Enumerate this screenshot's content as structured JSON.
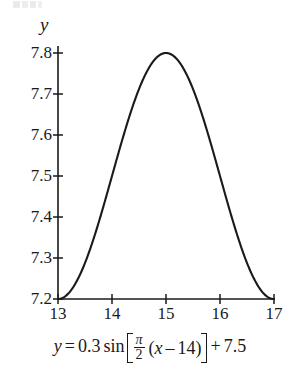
{
  "figure": {
    "axis_label_y": "y",
    "line_color": "#1a1a1a",
    "axis_color": "#1a1a1a",
    "background_color": "#ffffff"
  },
  "equation": {
    "lhs": "y",
    "equals": "=",
    "amplitude": "0.3",
    "function": "sin",
    "frac_numerator": "π",
    "frac_denominator": "2",
    "open_paren": "(",
    "inner_var": "x",
    "minus": "–",
    "phase": "14",
    "close_paren": ")",
    "plus": "+",
    "vertical_shift": "7.5",
    "plain_text": "y = 0.3 sin[π/2 (x – 14)] + 7.5"
  },
  "chart_data": {
    "type": "line",
    "title": "",
    "subtitle": "",
    "caption": "y = 0.3 sin[π/2 (x – 14)] + 7.5",
    "xlabel": "",
    "ylabel": "y",
    "xlim": [
      13,
      17
    ],
    "ylim": [
      7.2,
      7.8
    ],
    "xticks": [
      13,
      14,
      15,
      16,
      17
    ],
    "xtick_labels": [
      "13",
      "14",
      "15",
      "16",
      "17"
    ],
    "yticks": [
      7.2,
      7.3,
      7.4,
      7.5,
      7.6,
      7.7,
      7.8
    ],
    "ytick_labels": [
      "7.2",
      "7.3",
      "7.4",
      "7.5",
      "7.6",
      "7.7",
      "7.8"
    ],
    "grid": false,
    "legend": false,
    "legend_position": "none",
    "series": [
      {
        "name": "y = 0.3 sin[π/2 (x – 14)] + 7.5",
        "formula": {
          "amplitude": 0.3,
          "period_coefficient": 1.5707963268,
          "phase_shift": 14,
          "vertical_shift": 7.5
        },
        "x": [
          13.0,
          13.1,
          13.2,
          13.3,
          13.4,
          13.5,
          13.6,
          13.7,
          13.8,
          13.9,
          14.0,
          14.1,
          14.2,
          14.3,
          14.4,
          14.5,
          14.6,
          14.7,
          14.8,
          14.9,
          15.0,
          15.1,
          15.2,
          15.3,
          15.4,
          15.5,
          15.6,
          15.7,
          15.8,
          15.9,
          16.0,
          16.1,
          16.2,
          16.3,
          16.4,
          16.5,
          16.6,
          16.7,
          16.8,
          16.9,
          17.0
        ],
        "values": [
          7.2,
          7.201,
          7.205,
          7.211,
          7.219,
          7.229,
          7.242,
          7.256,
          7.273,
          7.291,
          7.311,
          7.332,
          7.354,
          7.377,
          7.401,
          7.424,
          7.448,
          7.471,
          7.493,
          7.514,
          7.535,
          7.553,
          7.57,
          7.586,
          7.599,
          7.612,
          7.622,
          7.63,
          7.636,
          7.64,
          7.641,
          7.64,
          7.636,
          7.63,
          7.622,
          7.612,
          7.599,
          7.586,
          7.57,
          7.553,
          7.535
        ],
        "key_points": [
          {
            "x": 13,
            "y": 7.2,
            "note": "minimum at left endpoint"
          },
          {
            "x": 15,
            "y": 7.8,
            "note": "maximum"
          },
          {
            "x": 17,
            "y": 7.2,
            "note": "minimum at right endpoint"
          }
        ]
      }
    ]
  }
}
